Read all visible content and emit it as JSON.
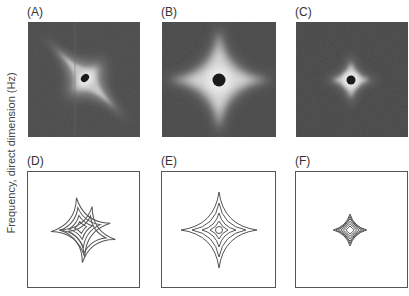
{
  "figure": {
    "y_axis_label": "Frequency, direct dimension (Hz)",
    "panels": [
      {
        "id": "A",
        "label": "(A)",
        "kind": "intensity-map",
        "description": "Grayscale spectrum, tilted star-shaped lineshape with dark center"
      },
      {
        "id": "B",
        "label": "(B)",
        "kind": "intensity-map",
        "description": "Grayscale spectrum, large symmetric four-pointed star with dark center"
      },
      {
        "id": "C",
        "label": "(C)",
        "kind": "intensity-map",
        "description": "Grayscale spectrum, small symmetric star with dark center"
      },
      {
        "id": "D",
        "label": "(D)",
        "kind": "contour-plot",
        "description": "Contour plot of tilted, distorted star lineshape",
        "contour_levels": 4
      },
      {
        "id": "E",
        "label": "(E)",
        "kind": "contour-plot",
        "description": "Contour plot of large symmetric star lineshape",
        "contour_levels": 5
      },
      {
        "id": "F",
        "label": "(F)",
        "kind": "contour-plot",
        "description": "Contour plot of small symmetric star lineshape",
        "contour_levels": 6
      }
    ]
  },
  "colors": {
    "background_dark": "#4a4a4a",
    "glow": "#e8e8e8",
    "center": "#1a1a1a",
    "contour": "#555555",
    "frame": "#555555"
  }
}
